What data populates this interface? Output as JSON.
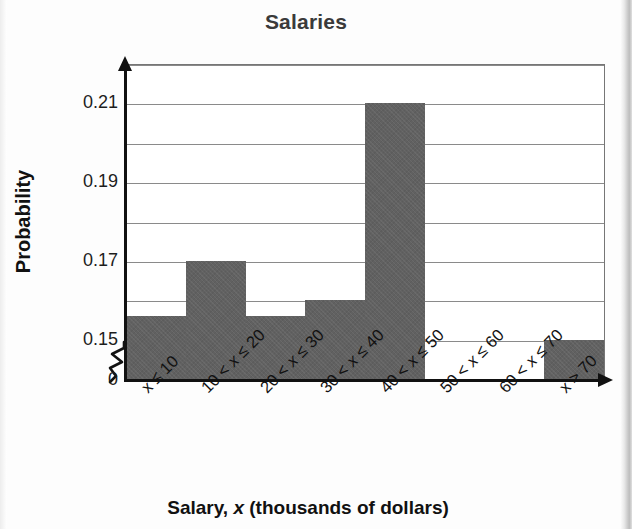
{
  "chart_data": {
    "type": "bar",
    "title": "Salaries",
    "xlabel": "Salary, x (thousands of dollars)",
    "ylabel": "Probability",
    "categories": [
      "x ≤ 10",
      "10 < x ≤ 20",
      "20 < x ≤ 30",
      "30 < x ≤ 40",
      "40 < x ≤ 50",
      "50 < x ≤ 60",
      "60 < x ≤ 70",
      "x > 70"
    ],
    "values": [
      0.156,
      0.17,
      0.156,
      0.16,
      0.21,
      0,
      0,
      0.15
    ],
    "ylim": [
      0.14,
      0.22
    ],
    "y_axis_break": true,
    "y_axis_break_label": "0",
    "y_tick_labels": [
      "0.15",
      "0.17",
      "0.19",
      "0.21"
    ],
    "y_tick_values": [
      0.15,
      0.17,
      0.19,
      0.21
    ],
    "y_gridline_values": [
      0.15,
      0.16,
      0.17,
      0.18,
      0.19,
      0.2,
      0.21,
      0.22
    ],
    "grid": true,
    "legend": "none",
    "bar_color": "#616161",
    "axis_color": "#111111",
    "gridline_color": "#8a8a8a"
  },
  "x_tick_parts": [
    {
      "pre": "x ≤ 10",
      "italic": "",
      "post": ""
    },
    {
      "pre": "10 < ",
      "italic": "x",
      "post": " ≤ 20"
    },
    {
      "pre": "20 < ",
      "italic": "x",
      "post": " ≤ 30"
    },
    {
      "pre": "30 < ",
      "italic": "x",
      "post": " ≤ 40"
    },
    {
      "pre": "40 < ",
      "italic": "x",
      "post": " ≤ 50"
    },
    {
      "pre": "50 < ",
      "italic": "x",
      "post": " ≤ 60"
    },
    {
      "pre": "60 < ",
      "italic": "x",
      "post": " ≤ 70"
    },
    {
      "pre": "x > 70",
      "italic": "",
      "post": ""
    }
  ],
  "x_axis_title_parts": {
    "pre": "Salary, ",
    "italic": "x",
    "post": " (thousands of dollars)"
  }
}
